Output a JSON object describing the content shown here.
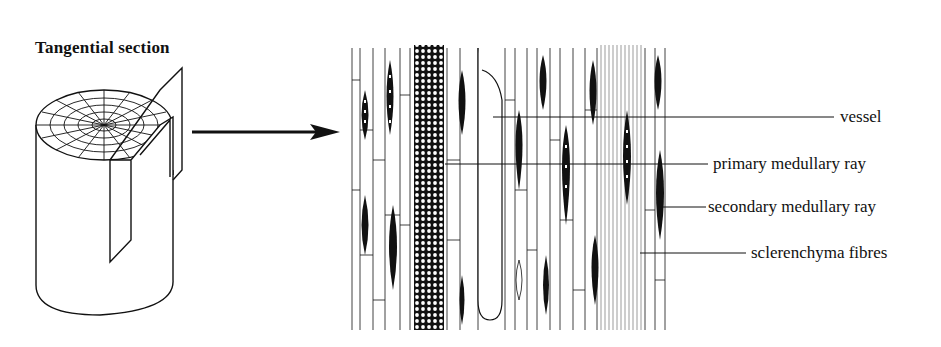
{
  "title": "Tangential section",
  "labels": [
    {
      "id": "vessel",
      "text": "vessel"
    },
    {
      "id": "primary",
      "text": "primary medullary ray"
    },
    {
      "id": "secondary",
      "text": "secondary medullary ray"
    },
    {
      "id": "sclerenchyma",
      "text": "sclerenchyma fibres"
    }
  ],
  "colors": {
    "ink": "#111111",
    "background": "#ffffff"
  }
}
